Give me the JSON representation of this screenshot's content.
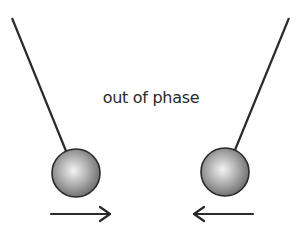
{
  "caption": "out of phase",
  "pendulums": [
    {
      "id": "left",
      "pivot": [
        12,
        18
      ],
      "bob_center": [
        76,
        173
      ],
      "bob_radius": 24,
      "motion": "right"
    },
    {
      "id": "right",
      "pivot": [
        289,
        18
      ],
      "bob_center": [
        225,
        172
      ],
      "bob_radius": 24,
      "motion": "left"
    }
  ],
  "colors": {
    "line": "#2a2a2a",
    "bob_light": "#f4f4f4",
    "bob_dark": "#6a6a6a"
  }
}
